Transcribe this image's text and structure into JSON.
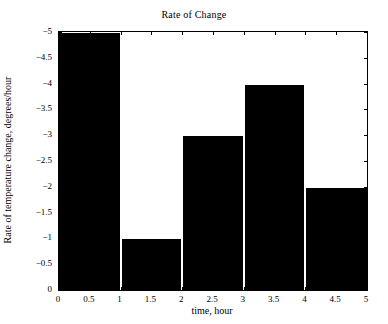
{
  "chart_data": {
    "type": "bar",
    "title": "Rate of Change",
    "xlabel": "time, hour",
    "ylabel": "Rate of temperature change, degrees/hour",
    "categories": [
      "0-1",
      "1-2",
      "2-3",
      "3-4",
      "4-5"
    ],
    "bin_edges": [
      0,
      1,
      2,
      3,
      4,
      5
    ],
    "values": [
      -5,
      -1,
      -3,
      -4,
      -2
    ],
    "xlim": [
      0,
      5
    ],
    "ylim": [
      -5,
      0
    ],
    "y_axis_direction": "reverse",
    "xticks": [
      "0",
      "0.5",
      "1",
      "1.5",
      "2",
      "2.5",
      "3",
      "3.5",
      "4",
      "4.5",
      "5"
    ],
    "xtick_values": [
      0,
      0.5,
      1,
      1.5,
      2,
      2.5,
      3,
      3.5,
      4,
      4.5,
      5
    ],
    "yticks": [
      "−5",
      "−4.5",
      "−4",
      "−3.5",
      "−3",
      "−2.5",
      "−2",
      "−1.5",
      "−1",
      "−0.5",
      "0"
    ],
    "ytick_values": [
      -5,
      -4.5,
      -4,
      -3.5,
      -3,
      -2.5,
      -2,
      -1.5,
      -1,
      -0.5,
      0
    ],
    "grid": false,
    "legend": null,
    "bar_color": "#000000",
    "axes_color": "#000000",
    "background_color": "#ffffff"
  }
}
